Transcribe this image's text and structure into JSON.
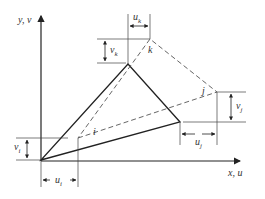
{
  "diagram": {
    "axes": {
      "y_label": "y, v",
      "x_label": "x, u"
    },
    "nodes": {
      "i": {
        "label": "i",
        "original": [
          41,
          160
        ],
        "displaced": [
          78,
          138
        ]
      },
      "j": {
        "label": "j",
        "original": [
          180,
          122
        ],
        "displaced": [
          217,
          92
        ]
      },
      "k": {
        "label": "k",
        "original": [
          128,
          64
        ],
        "displaced": [
          150,
          39
        ]
      }
    },
    "dimensions": {
      "u_i": "u",
      "u_i_sub": "i",
      "v_i": "v",
      "v_i_sub": "i",
      "u_j": "u",
      "u_j_sub": "j",
      "v_j": "v",
      "v_j_sub": "j",
      "u_k": "u",
      "u_k_sub": "k",
      "v_k": "v",
      "v_k_sub": "k"
    },
    "colors": {
      "line": "#222222",
      "dashed": "#555555"
    }
  }
}
